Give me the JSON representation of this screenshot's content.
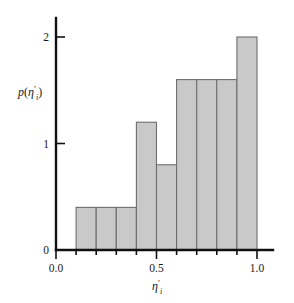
{
  "chart_data": {
    "type": "bar",
    "title": "",
    "xlabel": "η′ᵢ",
    "ylabel": "p(η′ᵢ)",
    "xlim": [
      0.0,
      1.05
    ],
    "ylim": [
      0.0,
      2.1
    ],
    "grid": false,
    "legend": null,
    "bin_width": 0.1,
    "bin_edges": [
      0.1,
      0.2,
      0.3,
      0.4,
      0.5,
      0.6,
      0.7,
      0.8,
      0.9,
      1.0
    ],
    "categories": [
      "0.1-0.2",
      "0.2-0.3",
      "0.3-0.4",
      "0.4-0.5",
      "0.5-0.6",
      "0.6-0.7",
      "0.7-0.8",
      "0.8-0.9",
      "0.9-1.0"
    ],
    "values": [
      0.4,
      0.4,
      0.4,
      1.2,
      0.8,
      1.6,
      1.6,
      1.6,
      2.0
    ],
    "x_ticks": [
      {
        "value": 0.0,
        "label": "0.0",
        "major": true
      },
      {
        "value": 0.1,
        "label": "",
        "major": false
      },
      {
        "value": 0.2,
        "label": "",
        "major": false
      },
      {
        "value": 0.3,
        "label": "",
        "major": false
      },
      {
        "value": 0.4,
        "label": "",
        "major": false
      },
      {
        "value": 0.5,
        "label": "0.5",
        "major": true
      },
      {
        "value": 0.6,
        "label": "",
        "major": false
      },
      {
        "value": 0.7,
        "label": "",
        "major": false
      },
      {
        "value": 0.8,
        "label": "",
        "major": false
      },
      {
        "value": 0.9,
        "label": "",
        "major": false
      },
      {
        "value": 1.0,
        "label": "1.0",
        "major": true
      }
    ],
    "y_ticks": [
      {
        "value": 0,
        "label": "0"
      },
      {
        "value": 1,
        "label": "1"
      },
      {
        "value": 2,
        "label": "2"
      }
    ],
    "bar_fill_color": "#c9c9c9",
    "bar_edge_color": "#6e6e6e",
    "axis_color": "#111111"
  },
  "labels": {
    "y_axis_p": "p",
    "y_axis_open": "(",
    "y_axis_eta": "η",
    "y_axis_prime": "′",
    "y_axis_sub": "i",
    "y_axis_close": ")",
    "x_axis_eta": "η",
    "x_axis_prime": "′",
    "x_axis_sub": "i",
    "tick_x_0": "0.0",
    "tick_x_5": "0.5",
    "tick_x_10": "1.0",
    "tick_y_0": "0",
    "tick_y_1": "1",
    "tick_y_2": "2"
  }
}
